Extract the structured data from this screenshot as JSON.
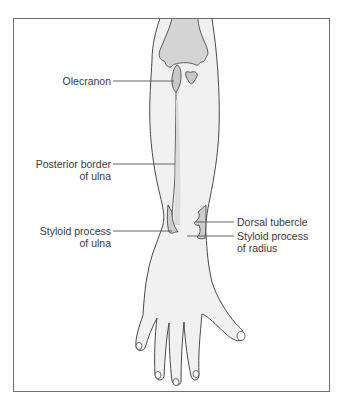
{
  "figure": {
    "colors": {
      "outline": "#4a4a4a",
      "skin": "#f1f1f1",
      "bone": "#c9c9c9",
      "leader_line": "#555555",
      "text": "#3a3a3a",
      "frame": "#6e6e6e"
    },
    "labels": [
      {
        "id": "olecranon",
        "lines": [
          "Olecranon"
        ],
        "side": "left"
      },
      {
        "id": "posterior-border-of-ulna",
        "lines": [
          "Posterior border",
          "of ulna"
        ],
        "side": "left"
      },
      {
        "id": "styloid-process-of-ulna",
        "lines": [
          "Styloid process",
          "of ulna"
        ],
        "side": "left"
      },
      {
        "id": "dorsal-tubercle",
        "lines": [
          "Dorsal tubercle"
        ],
        "side": "right"
      },
      {
        "id": "styloid-process-of-radius",
        "lines": [
          "Styloid process",
          "of radius"
        ],
        "side": "right"
      }
    ]
  }
}
